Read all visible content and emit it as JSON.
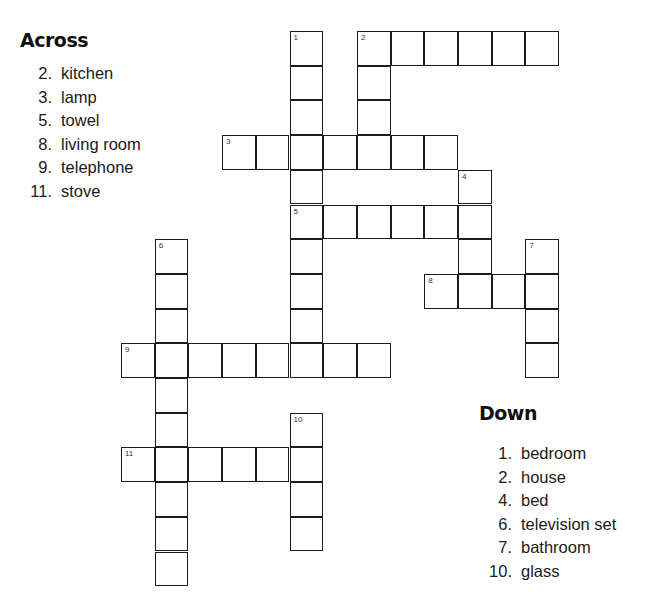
{
  "puzzle": {
    "grid": {
      "origin_x": 121,
      "origin_y": 31,
      "cell_w": 33.7,
      "cell_h": 34.7,
      "border_color": "#1c1c1c",
      "entries": [
        {
          "number": "1",
          "direction": "down",
          "col": 5,
          "row": 0,
          "length": 10
        },
        {
          "number": "2",
          "direction": "across",
          "col": 7,
          "row": 0,
          "length": 6
        },
        {
          "number": "2",
          "direction": "down",
          "col": 7,
          "row": 0,
          "length": 4
        },
        {
          "number": "3",
          "direction": "across",
          "col": 3,
          "row": 3,
          "length": 7
        },
        {
          "number": "4",
          "direction": "down",
          "col": 10,
          "row": 4,
          "length": 4
        },
        {
          "number": "5",
          "direction": "across",
          "col": 5,
          "row": 5,
          "length": 6
        },
        {
          "number": "6",
          "direction": "down",
          "col": 1,
          "row": 6,
          "length": 10
        },
        {
          "number": "7",
          "direction": "down",
          "col": 12,
          "row": 6,
          "length": 4
        },
        {
          "number": "8",
          "direction": "across",
          "col": 9,
          "row": 7,
          "length": 4
        },
        {
          "number": "9",
          "direction": "across",
          "col": 0,
          "row": 9,
          "length": 8
        },
        {
          "number": "10",
          "direction": "down",
          "col": 5,
          "row": 11,
          "length": 4
        },
        {
          "number": "11",
          "direction": "across",
          "col": 0,
          "row": 12,
          "length": 6
        }
      ]
    },
    "across": {
      "heading": "Across",
      "clues": [
        {
          "num": "2.",
          "word": "kitchen"
        },
        {
          "num": "3.",
          "word": "lamp"
        },
        {
          "num": "5.",
          "word": "towel"
        },
        {
          "num": "8.",
          "word": "living room"
        },
        {
          "num": "9.",
          "word": "telephone"
        },
        {
          "num": "11.",
          "word": "stove"
        }
      ]
    },
    "down": {
      "heading": "Down",
      "clues": [
        {
          "num": "1.",
          "word": "bedroom"
        },
        {
          "num": "2.",
          "word": "house"
        },
        {
          "num": "4.",
          "word": "bed"
        },
        {
          "num": "6.",
          "word": "television set"
        },
        {
          "num": "7.",
          "word": "bathroom"
        },
        {
          "num": "10.",
          "word": "glass"
        }
      ]
    }
  }
}
